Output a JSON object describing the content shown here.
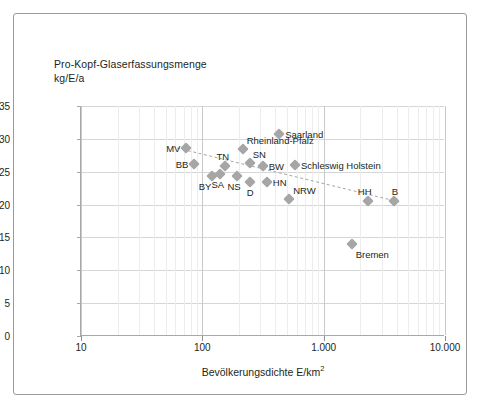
{
  "chart_data": {
    "type": "scatter",
    "title": "Pro-Kopf-Glaserfassungsmenge\nkg/E/a",
    "xlabel": "Bevölkerungsdichte E/km",
    "xlabel_sup": "2",
    "ylabel": "",
    "xscale": "log",
    "xlim": [
      10,
      10000
    ],
    "ylim": [
      0,
      35
    ],
    "yticks": [
      0,
      5,
      10,
      15,
      20,
      25,
      30,
      35
    ],
    "xticks": [
      10,
      100,
      1000,
      10000
    ],
    "xtick_labels": [
      "10",
      "100",
      "1.000",
      "10.000"
    ],
    "grid": true,
    "legend": "none",
    "marker_color": "#a6a6a6",
    "trendline": {
      "style": "dashed",
      "color": "#a6a6a6",
      "x": [
        62,
        4200
      ],
      "y": [
        28.6,
        20.4
      ]
    },
    "points": [
      {
        "label": "MV",
        "x": 74,
        "y": 28.6,
        "pos": "left"
      },
      {
        "label": "BB",
        "x": 86,
        "y": 26.2,
        "pos": "left"
      },
      {
        "label": "BY",
        "x": 121,
        "y": 24.3,
        "pos": "below-left"
      },
      {
        "label": "SA",
        "x": 140,
        "y": 24.6,
        "pos": "below"
      },
      {
        "label": "TN",
        "x": 154,
        "y": 25.8,
        "pos": "above"
      },
      {
        "label": "NS",
        "x": 192,
        "y": 24.3,
        "pos": "below"
      },
      {
        "label": "D",
        "x": 245,
        "y": 23.4,
        "pos": "below"
      },
      {
        "label": "SN",
        "x": 246,
        "y": 26.4,
        "pos": "above-left"
      },
      {
        "label": "Rheinland-Pfalz",
        "x": 215,
        "y": 28.5,
        "pos": "above-right"
      },
      {
        "label": "Saarland",
        "x": 430,
        "y": 30.8,
        "pos": "right"
      },
      {
        "label": "BW",
        "x": 315,
        "y": 25.8,
        "pos": "right"
      },
      {
        "label": "Schleswig Holstein",
        "x": 580,
        "y": 26.0,
        "pos": "right"
      },
      {
        "label": "HN",
        "x": 340,
        "y": 23.4,
        "pos": "right"
      },
      {
        "label": "NRW",
        "x": 520,
        "y": 20.9,
        "pos": "above-right"
      },
      {
        "label": "HH",
        "x": 2300,
        "y": 20.5,
        "pos": "above"
      },
      {
        "label": "B",
        "x": 3800,
        "y": 20.5,
        "pos": "above"
      },
      {
        "label": "Bremen",
        "x": 1700,
        "y": 14.0,
        "pos": "below-right"
      }
    ]
  }
}
